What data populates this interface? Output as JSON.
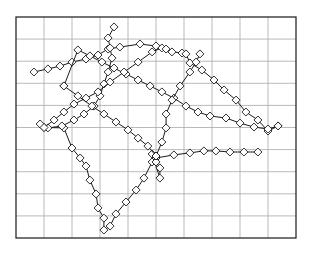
{
  "chart_data": {
    "type": "line",
    "title": "",
    "xlabel": "",
    "ylabel": "",
    "xlim": [
      0,
      10
    ],
    "ylim": [
      0,
      10
    ],
    "grid": true,
    "grid_divisions": {
      "x": 10,
      "y": 10
    },
    "legend": null,
    "tick_labels": {
      "x": [],
      "y": []
    },
    "marker": "diamond",
    "colors": {
      "line": "#1a1a1a",
      "marker_stroke": "#1a1a1a",
      "marker_fill": "#ffffff",
      "grid": "#a8a8a8",
      "frame": "#2a2a2a",
      "background": "#ffffff"
    },
    "series": [
      {
        "name": "trajectory-1",
        "points": [
          [
            0.64,
            7.51
          ],
          [
            1.14,
            7.65
          ],
          [
            1.57,
            7.78
          ],
          [
            2.0,
            7.96
          ],
          [
            2.5,
            8.1
          ],
          [
            2.93,
            8.28
          ],
          [
            3.29,
            8.55
          ],
          [
            3.71,
            8.64
          ],
          [
            4.43,
            8.78
          ],
          [
            5.0,
            8.69
          ],
          [
            5.57,
            8.42
          ],
          [
            5.93,
            8.37
          ],
          [
            6.07,
            8.33
          ],
          [
            6.21,
            7.92
          ],
          [
            6.64,
            7.6
          ],
          [
            7.07,
            7.15
          ],
          [
            7.43,
            6.7
          ],
          [
            7.86,
            6.24
          ],
          [
            8.21,
            5.7
          ],
          [
            8.64,
            5.34
          ],
          [
            9.0,
            4.84
          ],
          [
            9.36,
            5.07
          ]
        ]
      },
      {
        "name": "trajectory-2",
        "points": [
          [
            9.36,
            5.07
          ],
          [
            9.0,
            4.93
          ],
          [
            8.5,
            5.02
          ],
          [
            8.0,
            5.2
          ],
          [
            7.5,
            5.43
          ],
          [
            6.93,
            5.52
          ],
          [
            6.5,
            5.7
          ],
          [
            6.07,
            5.97
          ],
          [
            5.64,
            6.33
          ],
          [
            5.21,
            6.61
          ],
          [
            4.79,
            6.88
          ],
          [
            4.36,
            7.15
          ],
          [
            3.93,
            7.42
          ],
          [
            3.5,
            7.69
          ],
          [
            3.07,
            7.96
          ],
          [
            2.64,
            8.24
          ],
          [
            2.21,
            8.51
          ],
          [
            1.71,
            6.88
          ]
        ]
      },
      {
        "name": "trajectory-3",
        "points": [
          [
            1.0,
            5.0
          ],
          [
            1.71,
            4.98
          ],
          [
            2.0,
            4.07
          ],
          [
            2.29,
            3.62
          ],
          [
            2.5,
            3.26
          ],
          [
            2.64,
            2.62
          ],
          [
            2.86,
            1.99
          ],
          [
            2.93,
            1.36
          ],
          [
            3.14,
            0.9
          ],
          [
            3.14,
            0.36
          ],
          [
            3.36,
            0.54
          ],
          [
            3.57,
            1.09
          ],
          [
            3.93,
            1.63
          ],
          [
            4.29,
            2.17
          ],
          [
            4.57,
            2.71
          ],
          [
            4.86,
            3.44
          ],
          [
            5.0,
            3.71
          ]
        ]
      },
      {
        "name": "trajectory-4",
        "points": [
          [
            5.0,
            3.62
          ],
          [
            5.64,
            3.76
          ],
          [
            6.21,
            3.85
          ],
          [
            6.71,
            3.94
          ],
          [
            7.14,
            3.94
          ],
          [
            7.64,
            3.89
          ],
          [
            8.14,
            3.89
          ],
          [
            8.64,
            3.89
          ]
        ]
      },
      {
        "name": "trajectory-5",
        "points": [
          [
            5.0,
            3.62
          ],
          [
            4.86,
            3.8
          ],
          [
            5.14,
            2.71
          ],
          [
            5.14,
            3.17
          ],
          [
            5.0,
            3.44
          ]
        ]
      },
      {
        "name": "trajectory-6",
        "points": [
          [
            3.5,
            9.55
          ],
          [
            3.29,
            9.05
          ],
          [
            3.36,
            8.6
          ],
          [
            3.43,
            8.14
          ],
          [
            3.29,
            7.51
          ],
          [
            3.14,
            6.97
          ],
          [
            3.0,
            6.43
          ],
          [
            2.79,
            5.97
          ],
          [
            2.43,
            5.61
          ],
          [
            2.07,
            5.34
          ],
          [
            1.64,
            5.07
          ],
          [
            1.14,
            4.98
          ],
          [
            0.86,
            5.16
          ]
        ]
      },
      {
        "name": "trajectory-7",
        "points": [
          [
            1.0,
            5.0
          ],
          [
            1.36,
            5.34
          ],
          [
            1.71,
            5.7
          ],
          [
            2.07,
            6.06
          ],
          [
            2.5,
            6.33
          ],
          [
            2.93,
            6.61
          ],
          [
            3.36,
            7.06
          ],
          [
            3.86,
            7.51
          ],
          [
            4.36,
            7.96
          ],
          [
            4.86,
            8.42
          ],
          [
            5.21,
            8.6
          ],
          [
            5.36,
            8.55
          ]
        ]
      },
      {
        "name": "trajectory-8",
        "points": [
          [
            1.71,
            6.88
          ],
          [
            2.21,
            6.43
          ],
          [
            2.71,
            5.97
          ],
          [
            3.14,
            5.61
          ],
          [
            3.57,
            5.25
          ],
          [
            4.0,
            4.89
          ],
          [
            4.36,
            4.52
          ],
          [
            4.71,
            4.16
          ],
          [
            5.0,
            3.71
          ]
        ]
      },
      {
        "name": "trajectory-9",
        "points": [
          [
            5.0,
            3.71
          ],
          [
            5.21,
            4.34
          ],
          [
            5.36,
            4.98
          ],
          [
            5.36,
            5.61
          ],
          [
            5.57,
            6.24
          ],
          [
            5.86,
            6.88
          ],
          [
            6.21,
            7.51
          ],
          [
            6.43,
            7.96
          ],
          [
            6.57,
            8.33
          ]
        ]
      }
    ]
  }
}
